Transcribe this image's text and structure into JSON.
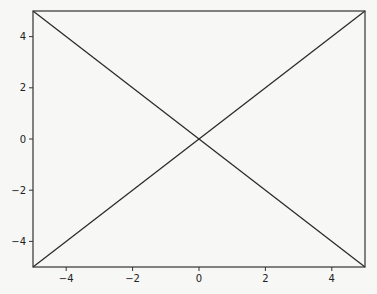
{
  "chart_data": {
    "type": "line",
    "title": "",
    "xlabel": "",
    "ylabel": "",
    "xlim": [
      -5,
      5
    ],
    "ylim": [
      -5,
      5
    ],
    "grid": false,
    "legend": null,
    "x": [
      -5,
      5
    ],
    "series": [
      {
        "name": "y = x",
        "values": [
          -5,
          5
        ],
        "color": "#2a2a2a"
      },
      {
        "name": "y = -x",
        "values": [
          5,
          -5
        ],
        "color": "#2a2a2a"
      }
    ],
    "xticks": [
      -4,
      -2,
      0,
      2,
      4
    ],
    "yticks": [
      -4,
      -2,
      0,
      2,
      4
    ],
    "xtick_labels": [
      "−4",
      "−2",
      "0",
      "2",
      "4"
    ],
    "ytick_labels": [
      "−4",
      "−2",
      "0",
      "2",
      "4"
    ]
  },
  "style": {
    "line_color": "#2a2a2a",
    "axis_color": "#333333",
    "background": "#f7f7f5"
  }
}
